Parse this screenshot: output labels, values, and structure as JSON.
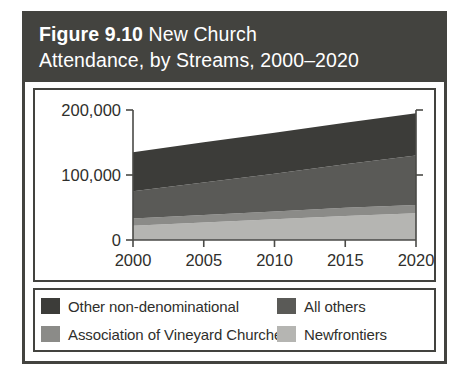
{
  "figure": {
    "label": "Figure 9.10",
    "title": "New Church",
    "title_line2": "Attendance, by Streams, 2000–2020",
    "header_color": "#43433f",
    "border_color": "#43433f",
    "background_color": "#ffffff"
  },
  "axes": {
    "y_ticks": [
      "0",
      "100,000",
      "200,000"
    ],
    "x_ticks": [
      "2000",
      "2005",
      "2010",
      "2015",
      "2020"
    ]
  },
  "legend": {
    "entries": [
      {
        "label": "Other non-denominational",
        "color": "#3c3c39"
      },
      {
        "label": "All others",
        "color": "#5a5a57"
      },
      {
        "label": "Association of Vineyard Churches",
        "color": "#8b8b88"
      },
      {
        "label": "Newfrontiers",
        "color": "#b5b5b2"
      }
    ]
  },
  "chart_data": {
    "type": "area",
    "title": "Figure 9.10 New Church Attendance, by Streams, 2000–2020",
    "xlabel": "",
    "ylabel": "",
    "stacked": true,
    "grid": false,
    "legend_position": "bottom",
    "x": [
      2000,
      2005,
      2010,
      2015,
      2020
    ],
    "xlim": [
      2000,
      2020
    ],
    "ylim": [
      0,
      200000
    ],
    "ytick_values": [
      0,
      100000,
      200000
    ],
    "series": [
      {
        "name": "Newfrontiers",
        "color": "#b5b5b2",
        "values": [
          22000,
          27000,
          32000,
          37000,
          41000
        ]
      },
      {
        "name": "Association of Vineyard Churches",
        "color": "#8b8b88",
        "values": [
          11000,
          11500,
          12000,
          12500,
          13000
        ]
      },
      {
        "name": "All others",
        "color": "#5a5a57",
        "values": [
          42000,
          50000,
          58000,
          67000,
          76000
        ]
      },
      {
        "name": "Other non-denominational",
        "color": "#3c3c39",
        "values": [
          60000,
          62000,
          63000,
          64000,
          65000
        ]
      }
    ],
    "totals": [
      135000,
      150500,
      165000,
      180500,
      195000
    ]
  }
}
